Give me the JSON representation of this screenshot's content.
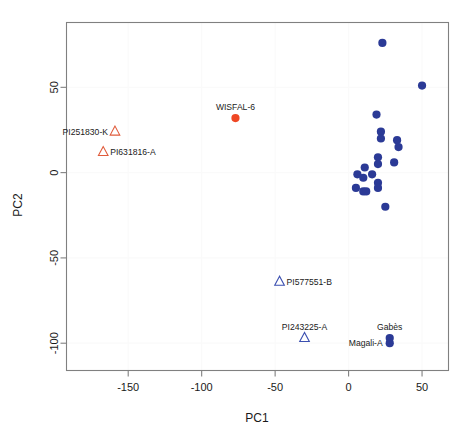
{
  "chart_data": {
    "type": "scatter",
    "title": "",
    "xlabel": "PC1",
    "ylabel": "PC2",
    "xlim": [
      -192,
      68
    ],
    "ylim": [
      -116,
      88
    ],
    "xticks": [
      -150,
      -100,
      -50,
      0,
      50
    ],
    "xtick_labels": [
      "-150",
      "-100",
      "-50",
      "0",
      "50"
    ],
    "yticks": [
      50,
      0,
      -50,
      -100
    ],
    "ytick_labels": [
      "50",
      "0",
      "-50",
      "-100"
    ],
    "grid": true,
    "grid_color": "#fafafa",
    "frame_color": "#808080",
    "legend": "none",
    "series": [
      {
        "name": "wild-accessions",
        "marker": "triangle-open",
        "color": "#e05c3c",
        "points": [
          {
            "label": "PI251830-K",
            "x": -159,
            "y": 24,
            "label_pos": "left"
          },
          {
            "label": "PI631816-A",
            "x": -167,
            "y": 12,
            "label_pos": "right"
          }
        ]
      },
      {
        "name": "highlighted-cultivar",
        "marker": "circle-filled",
        "color": "#ef4724",
        "points": [
          {
            "label": "WISFAL-6",
            "x": -77,
            "y": 32,
            "label_pos": "above"
          }
        ]
      },
      {
        "name": "landrace-accessions",
        "marker": "triangle-open",
        "color": "#3b4fb0",
        "points": [
          {
            "label": "PI577551-B",
            "x": -47,
            "y": -64,
            "label_pos": "right"
          },
          {
            "label": "PI243225-A",
            "x": -30,
            "y": -97,
            "label_pos": "above"
          }
        ]
      },
      {
        "name": "cultivated-accessions",
        "marker": "circle-filled",
        "color": "#2b3a96",
        "points": [
          {
            "label": "",
            "x": 23,
            "y": 76
          },
          {
            "label": "",
            "x": 50,
            "y": 51
          },
          {
            "label": "",
            "x": 19,
            "y": 34
          },
          {
            "label": "",
            "x": 22,
            "y": 24
          },
          {
            "label": "",
            "x": 22,
            "y": 20
          },
          {
            "label": "",
            "x": 33,
            "y": 19
          },
          {
            "label": "",
            "x": 34,
            "y": 15
          },
          {
            "label": "",
            "x": 20,
            "y": 9
          },
          {
            "label": "",
            "x": 20,
            "y": 5
          },
          {
            "label": "",
            "x": 31,
            "y": 6
          },
          {
            "label": "",
            "x": 11,
            "y": 3
          },
          {
            "label": "",
            "x": 6,
            "y": -1
          },
          {
            "label": "",
            "x": 16,
            "y": -1
          },
          {
            "label": "",
            "x": 10,
            "y": -3
          },
          {
            "label": "",
            "x": 20,
            "y": -6
          },
          {
            "label": "",
            "x": 20,
            "y": -9
          },
          {
            "label": "",
            "x": 5,
            "y": -9
          },
          {
            "label": "",
            "x": 10,
            "y": -11
          },
          {
            "label": "",
            "x": 12,
            "y": -11
          },
          {
            "label": "",
            "x": 25,
            "y": -20
          },
          {
            "label": "Gabès",
            "x": 28,
            "y": -97,
            "label_pos": "above"
          },
          {
            "label": "Magali-A",
            "x": 28,
            "y": -100,
            "label_pos": "left"
          }
        ]
      }
    ]
  }
}
